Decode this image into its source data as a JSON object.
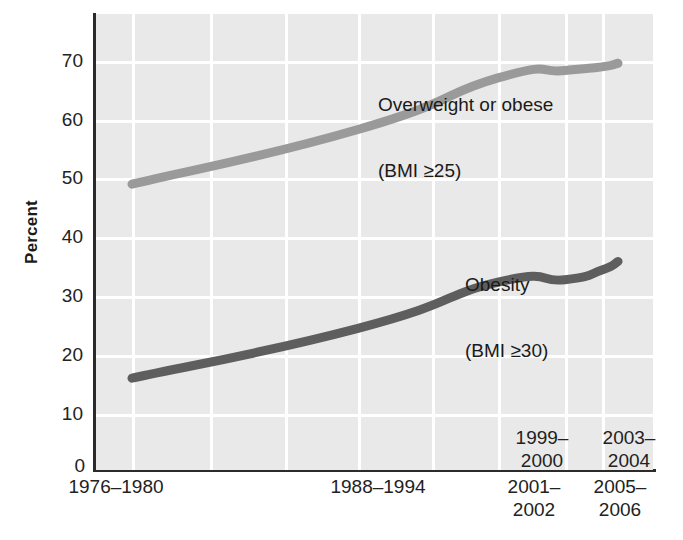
{
  "chart_data": {
    "type": "line",
    "title": "",
    "subtitle": "",
    "xlabel": "",
    "ylabel": "Percent",
    "ylim": [
      0,
      75
    ],
    "yticks": [
      0,
      10,
      20,
      30,
      40,
      50,
      60,
      70
    ],
    "ytick_labels": [
      "0",
      "10",
      "20",
      "30",
      "40",
      "50",
      "60",
      "70"
    ],
    "grid": true,
    "legend_position": "in-plot-annotation",
    "categories": [
      "1976–1980",
      "1988–1994",
      "1999–2000",
      "2001–2002",
      "2003–2004",
      "2005–2006"
    ],
    "xtick_labels_two_line": [
      {
        "line1": "1976–",
        "line2": "1980",
        "single": "1976–1980",
        "placement": "below-axis"
      },
      {
        "line1": "1988–",
        "line2": "1994",
        "single": "1988–1994",
        "placement": "below-axis"
      },
      {
        "line1": "1999–",
        "line2": "2000",
        "single": "1999–2000",
        "placement": "inside-plot"
      },
      {
        "line1": "2001–",
        "line2": "2002",
        "single": "2001–2002",
        "placement": "below-axis"
      },
      {
        "line1": "2003–",
        "line2": "2004",
        "single": "2003–2004",
        "placement": "inside-plot"
      },
      {
        "line1": "2005–",
        "line2": "2006",
        "single": "2005–2006",
        "placement": "below-axis"
      }
    ],
    "series": [
      {
        "name": "Overweight or obese (BMI ≥25)",
        "label_line1": "Overweight or obese",
        "label_line2": "(BMI ≥25)",
        "color": "#9a9a9a",
        "values": [
          47.0,
          56.0,
          64.5,
          65.7,
          66.3,
          66.9
        ]
      },
      {
        "name": "Obesity (BMI ≥30)",
        "label_line1": "Obesity",
        "label_line2": "(BMI ≥30)",
        "color": "#5e5e5e",
        "values": [
          15.1,
          23.3,
          30.9,
          31.3,
          32.9,
          34.3
        ]
      }
    ]
  },
  "axes": {
    "y_title": "Percent",
    "y_tick_0": "0",
    "y_tick_10": "10",
    "y_tick_20": "20",
    "y_tick_30": "30",
    "y_tick_40": "40",
    "y_tick_50": "50",
    "y_tick_60": "60",
    "y_tick_70": "70"
  },
  "annotations": {
    "overweight_line1": "Overweight or obese",
    "overweight_line2": "(BMI ≥25)",
    "obesity_line1": "Obesity",
    "obesity_line2": "(BMI ≥30)"
  },
  "xticks": {
    "t1976": "1976–1980",
    "t1988": "1988–1994",
    "t1999": "1999–\n2000",
    "t2001": "2001–\n2002",
    "t2003": "2003–\n2004",
    "t2005": "2005–\n2006"
  },
  "colors": {
    "plot_background": "#e9e9e9",
    "gridline": "#ffffff",
    "axis": "#2b2b2b",
    "series_overweight": "#9a9a9a",
    "series_obesity": "#5e5e5e",
    "text": "#1a1a1a"
  }
}
